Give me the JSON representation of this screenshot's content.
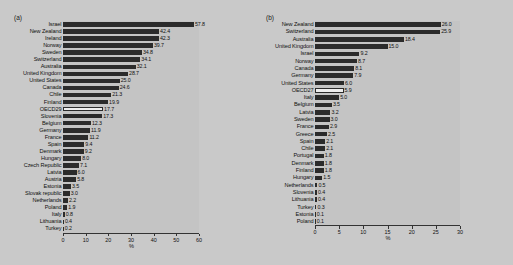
{
  "figure": {
    "background": "#c9c9c9",
    "bar_color": "#2b2b2b",
    "highlight_bar_color": "#eeeeee"
  },
  "chart_data": [
    {
      "type": "bar",
      "orientation": "horizontal",
      "panel": "(a)",
      "title": "",
      "xlabel": "%",
      "ylabel": "",
      "xlim": [
        0,
        60
      ],
      "xticks": [
        0,
        10,
        20,
        30,
        40,
        50,
        60
      ],
      "xticklabels": [
        "0",
        "10",
        "20",
        "30",
        "40",
        "50",
        "60"
      ],
      "grid": false,
      "legend": "none",
      "highlight_category": "OECD29",
      "categories": [
        "Israel",
        "New Zealand",
        "Ireland",
        "Norway",
        "Sweden",
        "Switzerland",
        "Australia",
        "United Kingdom",
        "United States",
        "Canada",
        "Chile",
        "Finland",
        "OECD29",
        "Slovenia",
        "Belgium",
        "Germany",
        "France",
        "Spain",
        "Denmark",
        "Hungary",
        "Czech Republic",
        "Latvia",
        "Austria",
        "Estonia",
        "Slovak republic",
        "Netherlands",
        "Poland",
        "Italy",
        "Lithuania",
        "Turkey"
      ],
      "values": [
        57.8,
        42.4,
        42.3,
        39.7,
        34.8,
        34.1,
        32.1,
        28.7,
        25.0,
        24.6,
        21.3,
        19.9,
        17.7,
        17.3,
        12.3,
        11.9,
        11.2,
        9.4,
        9.2,
        8.0,
        7.1,
        6.0,
        5.8,
        3.5,
        3.0,
        2.2,
        1.9,
        0.8,
        0.4,
        0.2
      ],
      "value_labels": [
        "57.8",
        "42.4",
        "42.3",
        "39.7",
        "34.8",
        "34.1",
        "32.1",
        "28.7",
        "25.0",
        "24.6",
        "21.3",
        "19.9",
        "17.7",
        "17.3",
        "12.3",
        "11.9",
        "11.2",
        "9.4",
        "9.2",
        "8.0",
        "7.1",
        "6.0",
        "5.8",
        "3.5",
        "3.0",
        "2.2",
        "1.9",
        "0.8",
        "0.4",
        "0.2"
      ]
    },
    {
      "type": "bar",
      "orientation": "horizontal",
      "panel": "(b)",
      "title": "",
      "xlabel": "%",
      "ylabel": "",
      "xlim": [
        0,
        30
      ],
      "xticks": [
        0,
        5,
        10,
        15,
        20,
        25,
        30
      ],
      "xticklabels": [
        "0",
        "5",
        "10",
        "15",
        "20",
        "25",
        "30"
      ],
      "grid": false,
      "legend": "none",
      "highlight_category": "OECD27",
      "categories": [
        "New Zealand",
        "Switzerland",
        "Australia",
        "United Kingdom",
        "Israel",
        "Norway",
        "Canada",
        "Germany",
        "United States",
        "OECD27",
        "Italy",
        "Belgium",
        "Latvia",
        "Sweden",
        "France",
        "Greece",
        "Spain",
        "Chile",
        "Portugal",
        "Denmark",
        "Finland",
        "Hungary",
        "Netherlands",
        "Slovenia",
        "Lithuania",
        "Turkey",
        "Estonia",
        "Poland"
      ],
      "values": [
        26.0,
        25.9,
        18.4,
        15.0,
        9.2,
        8.7,
        8.1,
        7.9,
        6.0,
        5.9,
        5.0,
        3.5,
        3.2,
        3.0,
        2.9,
        2.5,
        2.1,
        2.1,
        1.8,
        1.8,
        1.8,
        1.5,
        0.5,
        0.4,
        0.4,
        0.3,
        0.1,
        0.1
      ],
      "value_labels": [
        "26.0",
        "25.9",
        "18.4",
        "15.0",
        "9.2",
        "8.7",
        "8.1",
        "7.9",
        "6.0",
        "5.9",
        "5.0",
        "3.5",
        "3.2",
        "3.0",
        "2.9",
        "2.5",
        "2.1",
        "2.1",
        "1.8",
        "1.8",
        "1.8",
        "1.5",
        "0.5",
        "0.4",
        "0.4",
        "0.3",
        "0.1",
        "0.1"
      ]
    }
  ]
}
